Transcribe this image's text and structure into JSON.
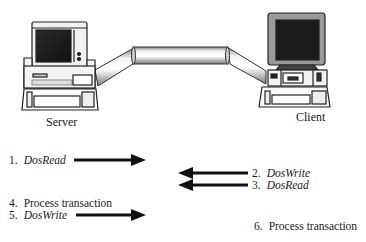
{
  "diagram": {
    "nodes": [
      {
        "id": "server",
        "label": "Server",
        "icon": "desktop-computer-icon"
      },
      {
        "id": "client",
        "label": "Client",
        "icon": "desktop-computer-icon"
      }
    ],
    "connection": {
      "type": "pipe",
      "from": "server",
      "to": "client"
    },
    "steps": [
      {
        "number": "1.",
        "text": "DosRead",
        "italic": true,
        "side": "server",
        "arrow": "right"
      },
      {
        "number": "2.",
        "text": "DosWrite",
        "italic": true,
        "side": "client",
        "arrow": "left"
      },
      {
        "number": "3.",
        "text": "DosRead",
        "italic": true,
        "side": "client",
        "arrow": "left"
      },
      {
        "number": "4.",
        "text": "Process transaction",
        "italic": false,
        "side": "server",
        "arrow": "none"
      },
      {
        "number": "5.",
        "text": "DosWrite",
        "italic": true,
        "side": "server",
        "arrow": "right"
      },
      {
        "number": "6.",
        "text": "Process transaction",
        "italic": false,
        "side": "client",
        "arrow": "none"
      }
    ]
  }
}
